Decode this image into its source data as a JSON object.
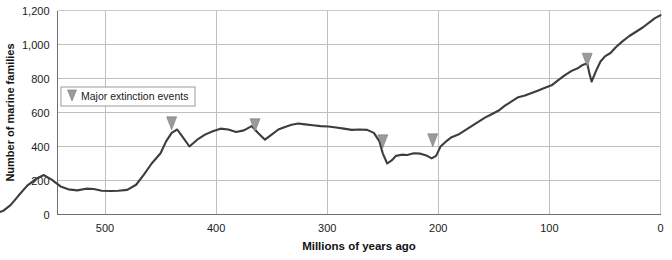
{
  "chart_data": {
    "type": "line",
    "title": "",
    "xlabel": "Millions of years ago",
    "ylabel": "Number of marine families",
    "xlim": [
      600,
      0
    ],
    "ylim": [
      0,
      1200
    ],
    "x_reversed": true,
    "grid": true,
    "legend_position": "upper-left-inside",
    "xticks": [
      500,
      400,
      300,
      200,
      100,
      0
    ],
    "xtick_labels": [
      "500",
      "400",
      "300",
      "200",
      "100",
      "0"
    ],
    "yticks": [
      0,
      200,
      400,
      600,
      800,
      1000,
      1200
    ],
    "ytick_labels": [
      "0",
      "200",
      "400",
      "600",
      "800",
      "1,000",
      "1,200"
    ],
    "series": [
      {
        "name": "Number of marine families",
        "color": "#3d3d3d",
        "x": [
          600,
          592,
          585,
          578,
          570,
          562,
          555,
          548,
          540,
          533,
          525,
          517,
          510,
          503,
          495,
          488,
          480,
          472,
          465,
          458,
          450,
          445,
          440,
          435,
          430,
          424,
          417,
          410,
          403,
          396,
          389,
          382,
          375,
          368,
          362,
          356,
          350,
          344,
          338,
          332,
          326,
          320,
          313,
          306,
          299,
          292,
          285,
          278,
          271,
          264,
          258,
          253,
          250,
          246,
          242,
          238,
          233,
          228,
          222,
          216,
          210,
          206,
          202,
          198,
          193,
          188,
          182,
          176,
          170,
          164,
          158,
          152,
          146,
          140,
          134,
          128,
          122,
          116,
          110,
          104,
          98,
          92,
          86,
          80,
          74,
          70,
          66,
          64,
          62,
          58,
          54,
          50,
          45,
          40,
          34,
          28,
          22,
          16,
          10,
          5,
          0
        ],
        "y": [
          5,
          20,
          55,
          110,
          170,
          210,
          232,
          205,
          165,
          148,
          142,
          152,
          150,
          140,
          138,
          140,
          145,
          175,
          235,
          300,
          360,
          430,
          480,
          500,
          455,
          400,
          440,
          470,
          490,
          505,
          500,
          485,
          495,
          520,
          478,
          440,
          470,
          500,
          515,
          528,
          535,
          530,
          525,
          520,
          518,
          512,
          505,
          498,
          500,
          498,
          480,
          430,
          360,
          300,
          318,
          345,
          352,
          350,
          360,
          358,
          345,
          330,
          345,
          400,
          430,
          455,
          470,
          495,
          520,
          545,
          570,
          590,
          610,
          640,
          665,
          690,
          700,
          715,
          730,
          745,
          760,
          790,
          820,
          845,
          862,
          880,
          890,
          830,
          782,
          845,
          900,
          930,
          950,
          985,
          1020,
          1050,
          1075,
          1100,
          1130,
          1155,
          1172
        ]
      }
    ],
    "markers": {
      "label": "Major extinction events",
      "glyph": "down-triangle",
      "color": "#9a9a9a",
      "events": [
        {
          "x": 440,
          "y": 498
        },
        {
          "x": 365,
          "y": 487
        },
        {
          "x": 250,
          "y": 392
        },
        {
          "x": 205,
          "y": 398
        },
        {
          "x": 66,
          "y": 872
        }
      ]
    }
  },
  "legend": {
    "items": [
      {
        "label": "Major extinction events",
        "icon": "down-triangle-icon",
        "color": "#9a9a9a"
      }
    ]
  },
  "axes": {
    "y_title": "Number of marine families",
    "x_title": "Millions of years ago"
  }
}
